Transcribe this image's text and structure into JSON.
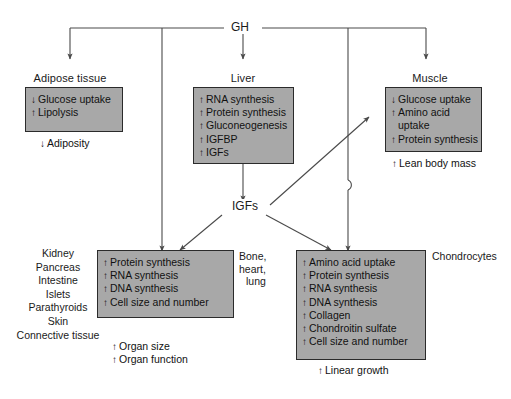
{
  "diagram": {
    "title_node": "GH",
    "intermediate_node": "IGFs",
    "colors": {
      "box_fill": "#a8a8a8",
      "box_border": "#2b2b2b",
      "line": "#4a4a4a",
      "text": "#111111",
      "background": "#ffffff"
    },
    "arrow_glyphs": {
      "up": "↑",
      "down": "↓"
    }
  },
  "targets": {
    "adipose": {
      "header": "Adipose tissue",
      "effects": [
        {
          "dir": "down",
          "label": "Glucose uptake"
        },
        {
          "dir": "up",
          "label": "Lipolysis"
        }
      ],
      "outcomes": [
        {
          "dir": "down",
          "label": "Adiposity"
        }
      ]
    },
    "liver": {
      "header": "Liver",
      "effects": [
        {
          "dir": "up",
          "label": "RNA synthesis"
        },
        {
          "dir": "up",
          "label": "Protein synthesis"
        },
        {
          "dir": "up",
          "label": "Gluconeogenesis"
        },
        {
          "dir": "up",
          "label": "IGFBP"
        },
        {
          "dir": "up",
          "label": "IGFs"
        }
      ],
      "outcomes": []
    },
    "muscle": {
      "header": "Muscle",
      "effects": [
        {
          "dir": "down",
          "label": "Glucose uptake"
        },
        {
          "dir": "up",
          "label": "Amino acid"
        },
        {
          "dir": "none",
          "label": "uptake"
        },
        {
          "dir": "up",
          "label": "Protein synthesis"
        }
      ],
      "outcomes": [
        {
          "dir": "up",
          "label": "Lean body mass"
        }
      ]
    },
    "organs": {
      "header": "",
      "tissue_list": [
        "Kidney",
        "Pancreas",
        "Intestine",
        "Islets",
        "Parathyroids",
        "Skin",
        "Connective tissue"
      ],
      "side_label_lines": [
        "Bone,",
        "heart,",
        "lung"
      ],
      "effects": [
        {
          "dir": "up",
          "label": "Protein synthesis"
        },
        {
          "dir": "up",
          "label": "RNA synthesis"
        },
        {
          "dir": "up",
          "label": "DNA synthesis"
        },
        {
          "dir": "up",
          "label": "Cell size and number"
        }
      ],
      "outcomes": [
        {
          "dir": "up",
          "label": "Organ size"
        },
        {
          "dir": "up",
          "label": "Organ function"
        }
      ]
    },
    "chondrocytes": {
      "header": "",
      "side_label": "Chondrocytes",
      "effects": [
        {
          "dir": "up",
          "label": "Amino acid uptake"
        },
        {
          "dir": "up",
          "label": "Protein synthesis"
        },
        {
          "dir": "up",
          "label": "RNA synthesis"
        },
        {
          "dir": "up",
          "label": "DNA synthesis"
        },
        {
          "dir": "up",
          "label": "Collagen"
        },
        {
          "dir": "up",
          "label": "Chondroitin sulfate"
        },
        {
          "dir": "up",
          "label": "Cell size and number"
        }
      ],
      "outcomes": [
        {
          "dir": "up",
          "label": "Linear growth"
        }
      ]
    }
  }
}
